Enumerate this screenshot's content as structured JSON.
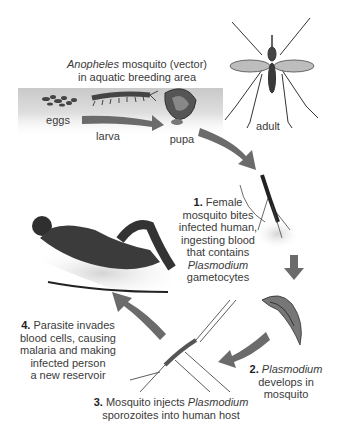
{
  "title": {
    "species": "Anopheles",
    "line1_rest": " mosquito (vector)",
    "line2": "in aquatic breeding area"
  },
  "stages": {
    "eggs": "eggs",
    "larva": "larva",
    "pupa": "pupa",
    "adult": "adult"
  },
  "steps": [
    {
      "num": "1.",
      "lines": [
        "Female",
        "mosquito bites",
        "infected human,",
        "ingesting blood",
        "that contains"
      ],
      "italic": "Plasmodium",
      "tail": "gametocytes"
    },
    {
      "num": "2.",
      "italic": "Plasmodium",
      "lines": [
        "develops in",
        "mosquito"
      ]
    },
    {
      "num": "3.",
      "pre": "Mosquito injects ",
      "italic": "Plasmodium",
      "line2": "sporozoites into human host"
    },
    {
      "num": "4.",
      "first": "Parasite invades",
      "lines": [
        "blood cells, causing",
        "malaria and making",
        "infected person",
        "a new reservoir"
      ]
    }
  ],
  "colors": {
    "arrow": "#6b6b6b",
    "water_band": "#d6d6d6",
    "shadow": "#e2e2e2",
    "ink": "#2a2a2a"
  }
}
